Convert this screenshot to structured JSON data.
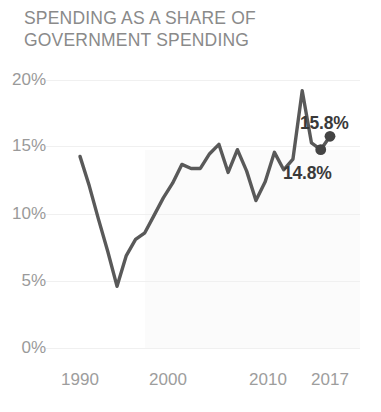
{
  "chart_data": {
    "type": "line",
    "title": "SPENDING AS A SHARE OF\nGOVERNMENT SPENDING",
    "xlabel": "",
    "ylabel": "",
    "xlim": [
      1990,
      2017
    ],
    "ylim": [
      0,
      20
    ],
    "grid": true,
    "legend": null,
    "line_color": "#595959",
    "marker_color": "#444444",
    "label_color": "#9a9a9a",
    "title_color": "#8a8a8a",
    "yticks": [
      {
        "value": 20,
        "label": "20%"
      },
      {
        "value": 15,
        "label": "15%"
      },
      {
        "value": 10,
        "label": "10%"
      },
      {
        "value": 5,
        "label": "5%"
      },
      {
        "value": 0,
        "label": "0%"
      }
    ],
    "xticks": [
      {
        "value": 1990,
        "label": "1990"
      },
      {
        "value": 2000,
        "label": "2000"
      },
      {
        "value": 2010,
        "label": "2010"
      },
      {
        "value": 2017,
        "label": "2017"
      }
    ],
    "x": [
      1990,
      1991,
      1992,
      1993,
      1994,
      1995,
      1996,
      1997,
      1998,
      1999,
      2000,
      2001,
      2002,
      2003,
      2004,
      2005,
      2006,
      2007,
      2008,
      2009,
      2010,
      2011,
      2012,
      2013,
      2014,
      2015,
      2016,
      2017
    ],
    "values": [
      14.3,
      12.1,
      9.6,
      7.2,
      4.6,
      6.9,
      8.1,
      8.6,
      9.9,
      11.2,
      12.3,
      13.7,
      13.4,
      13.4,
      14.5,
      15.2,
      13.1,
      14.8,
      13.2,
      11.0,
      12.4,
      14.6,
      13.3,
      14.1,
      19.2,
      15.3,
      14.8,
      15.8
    ],
    "series": [
      {
        "name": "Spending share",
        "values": [
          14.3,
          12.1,
          9.6,
          7.2,
          4.6,
          6.9,
          8.1,
          8.6,
          9.9,
          11.2,
          12.3,
          13.7,
          13.4,
          13.4,
          14.5,
          15.2,
          13.1,
          14.8,
          13.2,
          11.0,
          12.4,
          14.6,
          13.3,
          14.1,
          19.2,
          15.3,
          14.8,
          15.8
        ]
      }
    ],
    "markers": [
      {
        "x": 2016,
        "y": 14.8,
        "label": "14.8%",
        "label_position": "below-left"
      },
      {
        "x": 2017,
        "y": 15.8,
        "label": "15.8%",
        "label_position": "above-right"
      }
    ],
    "annotations": [
      {
        "text": "15.8%"
      },
      {
        "text": "14.8%"
      }
    ]
  }
}
